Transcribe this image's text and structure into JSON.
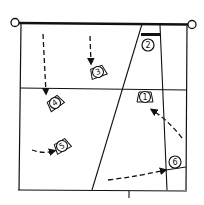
{
  "diagram": {
    "type": "volleyball court rotation / positioning diagram",
    "colors": {
      "ink": "#111111",
      "background": "#ffffff"
    },
    "players": [
      {
        "id": "1",
        "label": "1",
        "x": 145,
        "y": 97,
        "rot": 0
      },
      {
        "id": "2",
        "label": "2",
        "x": 148,
        "y": 45,
        "rot": 0
      },
      {
        "id": "3",
        "label": "3",
        "x": 98,
        "y": 72,
        "rot": -20
      },
      {
        "id": "4",
        "label": "4",
        "x": 55,
        "y": 103,
        "rot": -35
      },
      {
        "id": "5",
        "label": "5",
        "x": 62,
        "y": 146,
        "rot": -30
      },
      {
        "id": "6",
        "label": "6",
        "x": 175,
        "y": 162,
        "rot": 0
      }
    ],
    "movements": [
      {
        "player": "4",
        "desc": "dashed arrow down from back toward position 4"
      },
      {
        "player": "3",
        "desc": "dashed arrow down toward position 3"
      },
      {
        "player": "5",
        "desc": "dashed curved arrow from left into position 5"
      },
      {
        "player": "6",
        "desc": "dashed curved arrow from bottom-middle to position 6"
      },
      {
        "player": "1",
        "desc": "dashed arrow from right side up toward position 1"
      }
    ],
    "net": {
      "label": "net with posts"
    }
  }
}
